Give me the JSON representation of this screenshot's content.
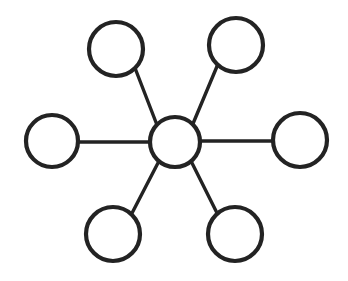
{
  "diagram": {
    "type": "hub-and-spoke",
    "canvas": {
      "width": 348,
      "height": 281,
      "background": "#ffffff"
    },
    "style": {
      "stroke_color": "#232323",
      "node_fill": "#ffffff",
      "node_stroke_width": 4.2,
      "edge_stroke_width": 3.4
    },
    "hub": {
      "id": "hub",
      "label": "",
      "cx": 175,
      "cy": 142,
      "r": 25
    },
    "nodes": [
      {
        "id": "node-top-left",
        "label": "",
        "cx": 116,
        "cy": 49,
        "r": 27
      },
      {
        "id": "node-top-right",
        "label": "",
        "cx": 236,
        "cy": 45,
        "r": 27
      },
      {
        "id": "node-left",
        "label": "",
        "cx": 52,
        "cy": 141,
        "r": 26
      },
      {
        "id": "node-right",
        "label": "",
        "cx": 300,
        "cy": 140,
        "r": 27
      },
      {
        "id": "node-bottom-left",
        "label": "",
        "cx": 113,
        "cy": 234,
        "r": 27
      },
      {
        "id": "node-bottom-right",
        "label": "",
        "cx": 235,
        "cy": 234,
        "r": 27
      }
    ],
    "edges": [
      {
        "id": "edge-hub-top-left",
        "from": "hub",
        "to": "node-top-left",
        "x1": 157,
        "y1": 125,
        "x2": 135,
        "y2": 68
      },
      {
        "id": "edge-hub-top-right",
        "from": "hub",
        "to": "node-top-right",
        "x1": 192,
        "y1": 126,
        "x2": 218,
        "y2": 64
      },
      {
        "id": "edge-hub-left",
        "from": "hub",
        "to": "node-left",
        "x1": 150,
        "y1": 142,
        "x2": 78,
        "y2": 142
      },
      {
        "id": "edge-hub-right",
        "from": "hub",
        "to": "node-right",
        "x1": 200,
        "y1": 141,
        "x2": 273,
        "y2": 141
      },
      {
        "id": "edge-hub-bottom-left",
        "from": "hub",
        "to": "node-bottom-left",
        "x1": 159,
        "y1": 161,
        "x2": 130,
        "y2": 217
      },
      {
        "id": "edge-hub-bottom-right",
        "from": "hub",
        "to": "node-bottom-right",
        "x1": 191,
        "y1": 161,
        "x2": 219,
        "y2": 217
      }
    ]
  }
}
